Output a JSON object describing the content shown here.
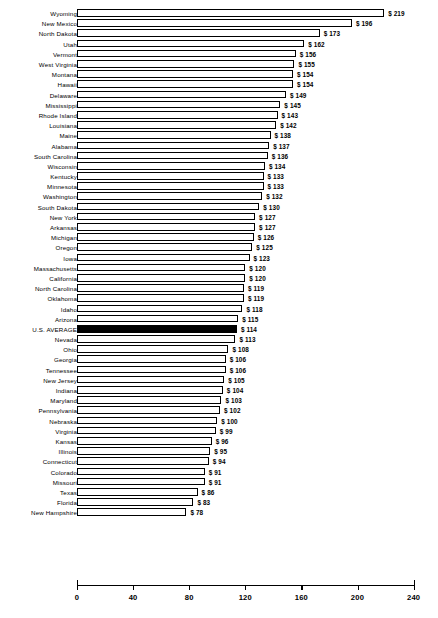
{
  "chart_data": {
    "type": "bar",
    "orientation": "horizontal",
    "title": "",
    "subtitle": "",
    "xlabel": "",
    "ylabel": "",
    "xlim": [
      0,
      240
    ],
    "xticks": [
      0,
      40,
      80,
      120,
      160,
      200,
      240
    ],
    "xtick_labels": [
      "0",
      "40",
      "80",
      "120",
      "160",
      "200",
      "240"
    ],
    "grid": false,
    "legend": null,
    "value_prefix": "$",
    "highlight_category": "U.S. AVERAGE",
    "highlight_color": "#000000",
    "bar_fill_color": "#ffffff",
    "bar_border_color": "#000000",
    "categories": [
      "Wyoming",
      "New Mexico",
      "North Dakota",
      "Utah",
      "Vermont",
      "West Virginia",
      "Montana",
      "Hawaii",
      "Delaware",
      "Mississippi",
      "Rhode Island",
      "Louisiana",
      "Maine",
      "Alabama",
      "South Carolina",
      "Wisconsin",
      "Kentucky",
      "Minnesota",
      "Washington",
      "South Dakota",
      "New York",
      "Arkansas",
      "Michigan",
      "Oregon",
      "Iowa",
      "Massachusetts",
      "California",
      "North Carolina",
      "Oklahoma",
      "Idaho",
      "Arizona",
      "U.S. AVERAGE",
      "Nevada",
      "Ohio",
      "Georgia",
      "Tennessee",
      "New Jersey",
      "Indiana",
      "Maryland",
      "Pennsylvania",
      "Nebraska",
      "Virginia",
      "Kansas",
      "Illinois",
      "Connecticut",
      "Colorado",
      "Missouri",
      "Texas",
      "Florida",
      "New Hampshire"
    ],
    "values": [
      219,
      196,
      173,
      162,
      156,
      155,
      154,
      154,
      149,
      145,
      143,
      142,
      138,
      137,
      136,
      134,
      133,
      133,
      132,
      130,
      127,
      127,
      126,
      125,
      123,
      120,
      120,
      119,
      119,
      118,
      115,
      114,
      113,
      108,
      106,
      106,
      105,
      104,
      103,
      102,
      100,
      99,
      96,
      95,
      94,
      91,
      91,
      86,
      83,
      78
    ],
    "value_labels": [
      "$ 219",
      "$ 196",
      "$ 173",
      "$ 162",
      "$ 156",
      "$ 155",
      "$ 154",
      "$ 154",
      "$ 149",
      "$ 145",
      "$ 143",
      "$ 142",
      "$ 138",
      "$ 137",
      "$ 136",
      "$ 134",
      "$ 133",
      "$ 133",
      "$ 132",
      "$ 130",
      "$ 127",
      "$ 127",
      "$ 126",
      "$ 125",
      "$ 123",
      "$ 120",
      "$ 120",
      "$ 119",
      "$ 119",
      "$ 118",
      "$ 115",
      "$ 114",
      "$ 113",
      "$ 108",
      "$ 106",
      "$ 106",
      "$ 105",
      "$ 104",
      "$ 103",
      "$ 102",
      "$ 100",
      "$ 99",
      "$ 96",
      "$ 95",
      "$ 94",
      "$ 91",
      "$ 91",
      "$ 86",
      "$ 83",
      "$ 78"
    ]
  }
}
